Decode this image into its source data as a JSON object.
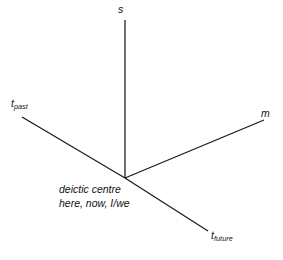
{
  "figure": {
    "background_color": "#ffffff",
    "line_color": "#1a1a1a",
    "text_color": "#111111",
    "width": 283,
    "height": 260
  },
  "axes": {
    "origin": {
      "x": 125,
      "y": 178
    },
    "vertical": {
      "name": "s",
      "label": "s",
      "from": {
        "x": 125,
        "y": 20
      },
      "to": {
        "x": 125,
        "y": 178
      }
    },
    "modality": {
      "name": "m",
      "label": "m",
      "from": {
        "x": 125,
        "y": 178
      },
      "to": {
        "x": 264,
        "y": 120
      }
    },
    "time": {
      "name": "t",
      "past_label_base": "t",
      "past_label_sub": "past",
      "future_label_base": "t",
      "future_label_sub": "future",
      "from": {
        "x": 22,
        "y": 117
      },
      "through": {
        "x": 125,
        "y": 178
      },
      "to": {
        "x": 208,
        "y": 231
      }
    }
  },
  "centre": {
    "line1": "deictic centre",
    "line2": "here, now, I/we"
  }
}
